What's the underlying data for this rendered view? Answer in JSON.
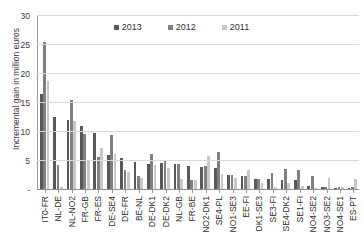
{
  "chart_data": {
    "type": "bar",
    "title": "",
    "xlabel": "",
    "ylabel": "Incremental gain in million euros",
    "ylim": [
      0,
      30
    ],
    "yticks": [
      "-",
      "5",
      "10",
      "15",
      "20",
      "25",
      "30"
    ],
    "ytick_values": [
      0,
      5,
      10,
      15,
      20,
      25,
      30
    ],
    "grid": true,
    "legend_position": "top-center",
    "categories": [
      "IT0-FR",
      "NL-DE",
      "NL-NO2",
      "FR-GB",
      "FR-ES",
      "DE-SE4",
      "DE-FR",
      "BE-NL",
      "DE-DK1",
      "DE-DK2",
      "NL-GB",
      "FR-BE",
      "NO2-DK1",
      "SE4-PL",
      "NO1-SE3",
      "EE-FI",
      "DK1-SE3",
      "SE3-FI",
      "SE4-DK2",
      "SE1-FI",
      "NO4-SE2",
      "NO3-SE2",
      "NO4-SE1",
      "ES-PT"
    ],
    "series": [
      {
        "name": "2013",
        "color": "#595959",
        "values": [
          16.3,
          12.5,
          11.9,
          10.9,
          9.7,
          5.8,
          5.4,
          4.7,
          4.3,
          4.4,
          4.3,
          3.9,
          3.8,
          3.7,
          2.4,
          2.2,
          1.8,
          1.7,
          1.6,
          1.5,
          0.5,
          0.4,
          0.15,
          0.15
        ]
      },
      {
        "name": "2012",
        "color": "#808080",
        "values": [
          25.3,
          4.1,
          15.4,
          9.5,
          5.6,
          9.3,
          3.3,
          2.2,
          6.0,
          4.9,
          4.3,
          1.6,
          3.9,
          6.4,
          2.4,
          2.2,
          1.7,
          2.8,
          3.5,
          3.2,
          2.3,
          0.3,
          0.3,
          0.3
        ]
      },
      {
        "name": "2011",
        "color": "#c8c8c8",
        "values": [
          18.7,
          0.3,
          11.7,
          5.0,
          7.0,
          6.0,
          3.0,
          1.9,
          4.1,
          3.6,
          1.8,
          1.5,
          5.7,
          2.6,
          1.9,
          3.3,
          1.1,
          0.3,
          1.1,
          0.5,
          0.2,
          1.9,
          0.4,
          1.8
        ]
      }
    ]
  },
  "legend": {
    "items": [
      {
        "label": "2013",
        "color": "#595959"
      },
      {
        "label": "2012",
        "color": "#808080"
      },
      {
        "label": "2011",
        "color": "#c8c8c8"
      }
    ]
  }
}
